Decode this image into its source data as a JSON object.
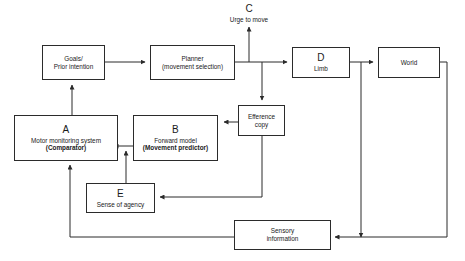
{
  "diagram": {
    "line_color": "#2b2b2b",
    "box_fill": "#ffffff",
    "nodes": [
      {
        "id": "goals",
        "letter": "",
        "line1": "Goals/",
        "line2": "Prior intention",
        "bold_line2": false
      },
      {
        "id": "planner",
        "letter": "",
        "line1": "Planner",
        "line2": "(movement selection)",
        "bold_line2": false
      },
      {
        "id": "limb",
        "letter": "D",
        "line1": "Limb",
        "line2": "",
        "bold_line2": false
      },
      {
        "id": "world",
        "letter": "",
        "line1": "World",
        "line2": "",
        "bold_line2": false
      },
      {
        "id": "efference",
        "letter": "",
        "line1": "Efference",
        "line2": "copy",
        "bold_line2": false
      },
      {
        "id": "comparator",
        "letter": "A",
        "line1": "Motor monitoring system",
        "line2": "(Comparator)",
        "bold_line2": true
      },
      {
        "id": "forward",
        "letter": "B",
        "line1": "Forward model",
        "line2": "(Movement predictor)",
        "bold_line2": true
      },
      {
        "id": "agency",
        "letter": "E",
        "line1": "Sense of agency",
        "line2": "",
        "bold_line2": false
      },
      {
        "id": "sensory",
        "letter": "",
        "line1": "Sensory",
        "line2": "information",
        "bold_line2": false
      }
    ],
    "free_labels": [
      {
        "id": "urge",
        "letter": "C",
        "sub": "Urge to move"
      }
    ]
  }
}
